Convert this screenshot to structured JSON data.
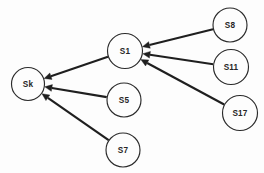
{
  "diagram": {
    "background_color": "#fdfdfd",
    "node_fill_color": "#fdfdfd",
    "node_stroke_color": "#2b2b2b",
    "edge_color": "#1f1f1f",
    "label_color": "#262626",
    "width": 264,
    "height": 173,
    "nodes": [
      {
        "id": "Sk",
        "label": "Sk",
        "cx": 28,
        "cy": 84,
        "r": 16.5
      },
      {
        "id": "S1",
        "label": "S1",
        "cx": 125,
        "cy": 51,
        "r": 17.5
      },
      {
        "id": "S5",
        "label": "S5",
        "cx": 124,
        "cy": 100,
        "r": 17.0
      },
      {
        "id": "S7",
        "label": "S7",
        "cx": 123,
        "cy": 150,
        "r": 17.0
      },
      {
        "id": "S8",
        "label": "S8",
        "cx": 230,
        "cy": 25,
        "r": 17.0
      },
      {
        "id": "S11",
        "label": "S11",
        "cx": 231,
        "cy": 67,
        "r": 17.5
      },
      {
        "id": "S17",
        "label": "S17",
        "cx": 240,
        "cy": 113,
        "r": 17.5
      }
    ],
    "edges": [
      {
        "id": "edge-s1-sk",
        "from": "S1",
        "to": "Sk",
        "directed": true
      },
      {
        "id": "edge-s5-sk",
        "from": "S5",
        "to": "Sk",
        "directed": true
      },
      {
        "id": "edge-s7-sk",
        "from": "S7",
        "to": "Sk",
        "directed": true
      },
      {
        "id": "edge-s8-s1",
        "from": "S8",
        "to": "S1",
        "directed": true
      },
      {
        "id": "edge-s11-s1",
        "from": "S11",
        "to": "S1",
        "directed": true
      },
      {
        "id": "edge-s17-s1",
        "from": "S17",
        "to": "S1",
        "directed": true
      }
    ]
  }
}
